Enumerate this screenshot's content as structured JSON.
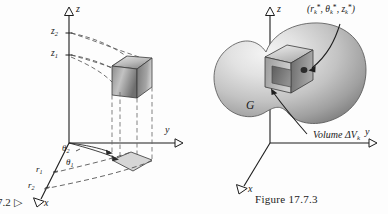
{
  "page": {
    "background_color": "#fdfdfd",
    "ink_color": "#1c1c1c"
  },
  "corner_reference": {
    "text": "7.2  ▷",
    "note": "partial figure cross-reference cropped at left page edge"
  },
  "figure_left": {
    "name": "cylindrical-wedge-diagram",
    "axis_labels": {
      "x": "x",
      "y": "y",
      "z": "z"
    },
    "z_ticks": [
      {
        "id": "z2",
        "base": "z",
        "sub": "2"
      },
      {
        "id": "z1",
        "base": "z",
        "sub": "1"
      }
    ],
    "radius_labels": [
      {
        "id": "r1",
        "base": "r",
        "sub": "1"
      },
      {
        "id": "r2",
        "base": "r",
        "sub": "2"
      }
    ],
    "angle_labels": [
      {
        "id": "theta2",
        "base": "θ",
        "sub": "2"
      },
      {
        "id": "theta1",
        "base": "θ",
        "sub": "1"
      }
    ],
    "elements": {
      "cube": "shaded-cube-solid",
      "base_patch": "shaded-polar-rectangle",
      "projection_lines": "dashed",
      "arcs": "dashed"
    }
  },
  "figure_right": {
    "name": "solid-G-volume-element-diagram",
    "axis_labels": {
      "x": "x",
      "y": "y",
      "z": "z"
    },
    "solid_label": "G",
    "point_label": {
      "open": "(",
      "r": "r",
      "r_sub": "k",
      "theta": "θ",
      "theta_sub": "k",
      "z": "z",
      "z_sub": "k",
      "star": "*",
      "sep": ", ",
      "close": ")",
      "full_text": "(rₖ*, θₖ*, zₖ*)"
    },
    "volume_label": {
      "word": "Volume",
      "symbol": "ΔV",
      "sub": "k"
    },
    "caption": "Figure  17.7.3",
    "elements": {
      "blob": "shaded-blob-solid",
      "cube": "shaded-cube-cavity",
      "leader_lines": "curved-arrow"
    }
  }
}
